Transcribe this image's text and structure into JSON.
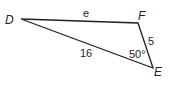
{
  "diagram": {
    "type": "triangle",
    "vertices": [
      {
        "name": "D",
        "x": 21,
        "y": 19
      },
      {
        "name": "F",
        "x": 138,
        "y": 23
      },
      {
        "name": "E",
        "x": 153,
        "y": 68
      }
    ],
    "labels": {
      "vertex_d": "D",
      "vertex_f": "F",
      "vertex_e": "E",
      "side_df": "e",
      "side_de": "16",
      "side_fe": "5",
      "angle_e": "50°"
    },
    "stroke_color": "#231f20"
  }
}
